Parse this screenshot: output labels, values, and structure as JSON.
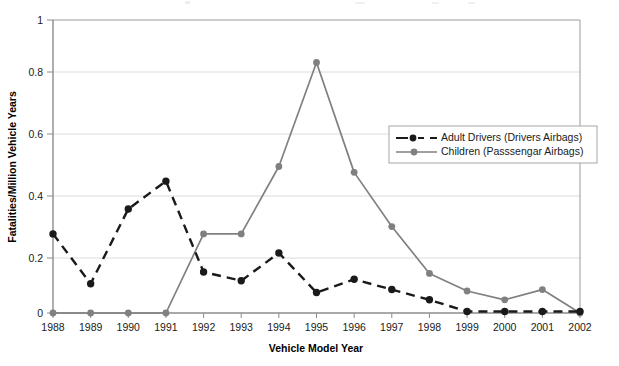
{
  "chart_data": {
    "type": "line",
    "title": "",
    "xlabel": "Vehicle Model Year",
    "ylabel": "Fatalities/Million Vehicle Years",
    "categories": [
      "1988",
      "1989",
      "1990",
      "1991",
      "1992",
      "1993",
      "1994",
      "1995",
      "1996",
      "1997",
      "1998",
      "1999",
      "2000",
      "2001",
      "2002"
    ],
    "x": [
      1988,
      1989,
      1990,
      1991,
      1992,
      1993,
      1994,
      1995,
      1996,
      1997,
      1998,
      1999,
      2000,
      2001,
      2002
    ],
    "ylim": [
      0,
      1
    ],
    "xlim": [
      1988,
      2002
    ],
    "y_ticks": [
      "0",
      "0.2",
      "0.4",
      "0.6",
      "0.8",
      "1"
    ],
    "y_tick_values": [
      0,
      0.2,
      0.4,
      0.6,
      0.8,
      1
    ],
    "grid": "horizontal",
    "legend_position": "inside-upper-right",
    "series": [
      {
        "name": "Adult Drivers (Drivers Airbags)",
        "color": "#1a1a1a",
        "style": "dashed",
        "marker": "circle",
        "values": [
          0.27,
          0.1,
          0.355,
          0.45,
          0.14,
          0.11,
          0.205,
          0.07,
          0.115,
          0.08,
          0.045,
          0.005,
          0.005,
          0.005,
          0.005
        ]
      },
      {
        "name": "Children (Passsengar Airbags)",
        "color": "#808080",
        "style": "solid",
        "marker": "circle",
        "values": [
          0.0,
          0.0,
          0.0,
          0.0,
          0.27,
          0.27,
          0.5,
          0.855,
          0.48,
          0.295,
          0.135,
          0.075,
          0.045,
          0.08,
          0.0
        ]
      }
    ]
  },
  "axes": {
    "x_title": "Vehicle Model Year",
    "y_title": "Fatalities/Million Vehicle Years"
  },
  "legend": {
    "entries": [
      {
        "label": "Adult Drivers (Drivers Airbags)"
      },
      {
        "label": "Children (Passsengar Airbags)"
      }
    ]
  },
  "colors": {
    "adult_series": "#1a1a1a",
    "children_series": "#808080",
    "axis": "#808080",
    "gridline": "#d9d9d9",
    "plot_border": "#808080",
    "legend_border": "#a6a6a6",
    "text": "#1a1a1a"
  }
}
